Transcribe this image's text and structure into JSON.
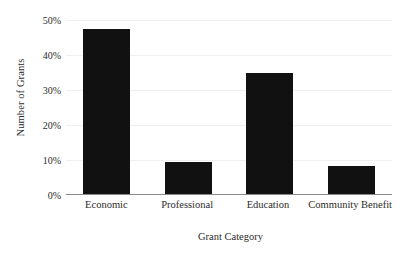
{
  "chart_data": {
    "type": "bar",
    "title": "",
    "subtitle": "",
    "xlabel": "Grant Category",
    "ylabel": "Number of Grants",
    "categories": [
      "Economic",
      "Professional",
      "Education",
      "Community Benefit"
    ],
    "values": [
      47.5,
      9.3,
      34.8,
      8.0
    ],
    "series": [
      {
        "name": "Number of Grants",
        "values": [
          47.5,
          9.3,
          34.8,
          8.0
        ]
      }
    ],
    "ylim": [
      0,
      50
    ],
    "ytick_values": [
      0,
      10,
      20,
      30,
      40,
      50
    ],
    "ytick_labels": [
      "0%",
      "10%",
      "20%",
      "30%",
      "40%",
      "50%"
    ],
    "grid": true,
    "grid_axis": "y",
    "legend": false,
    "legend_position": "none",
    "bar_color": "#111111",
    "gridline_color": "#f0f0f0",
    "axis_color": "#8a8a8a",
    "background_color": "#ffffff",
    "value_format": "percent",
    "annotations": []
  }
}
